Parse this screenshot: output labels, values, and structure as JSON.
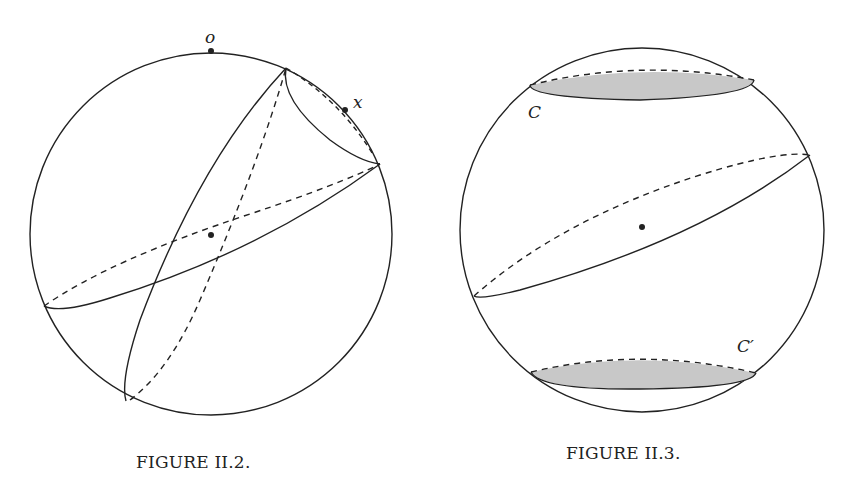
{
  "figures": [
    {
      "id": "II.2",
      "caption": "FIGURE II.2.",
      "labels": {
        "top_point": "o",
        "cap_point": "x"
      },
      "description": "Sphere with two great circles (solid front, dashed back), a small circle cap near point x, center point marked"
    },
    {
      "id": "II.3",
      "caption": "FIGURE II.3.",
      "labels": {
        "upper_cap": "C",
        "lower_cap": "C′"
      },
      "description": "Sphere with a tilted great circle, shaded upper cap C and shaded lower cap C′, center point marked"
    }
  ],
  "colors": {
    "stroke": "#222222",
    "cap_fill": "#c8c8c8",
    "background": "#ffffff"
  }
}
